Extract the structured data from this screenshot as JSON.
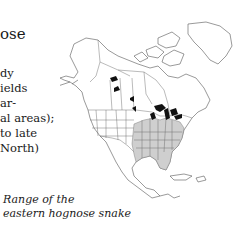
{
  "text_block": {
    "heading": "ose",
    "habitat_lines": [
      "dy",
      "ields",
      "ar-",
      "al areas);",
      "to late",
      "North)"
    ]
  },
  "map": {
    "subject": "North America range map",
    "range_region": "eastern United States",
    "colors": {
      "range_fill": "#cfcfcf",
      "outline": "#555555",
      "lakes": "#111111",
      "background": "#ffffff"
    }
  },
  "caption": {
    "line1": "Range of the",
    "line2": "eastern hognose snake"
  }
}
